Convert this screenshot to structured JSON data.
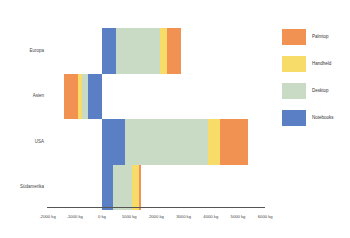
{
  "chart_data": {
    "type": "bar",
    "orientation": "horizontal",
    "stacked": true,
    "title": "",
    "xlabel": "",
    "ylabel": "",
    "categories": [
      "Europa",
      "Asien",
      "USA",
      "Südamerika"
    ],
    "x_ticks": [
      "-2000 kg",
      "-1000 kg",
      "0 kg",
      "1000 kg",
      "2000 kg",
      "3000 kg",
      "4000 kg",
      "5000 kg",
      "6000 kg"
    ],
    "xlim": [
      -2000,
      6000
    ],
    "grid": false,
    "legend_position": "right",
    "series": [
      {
        "name": "Notebooks",
        "color": "#5B7FC4",
        "values": [
          500,
          -500,
          850,
          400
        ]
      },
      {
        "name": "Desktop",
        "color": "#C9DBC4",
        "values": [
          1650,
          -250,
          3050,
          700
        ]
      },
      {
        "name": "Handheld",
        "color": "#F8DC6A",
        "values": [
          250,
          -150,
          450,
          250
        ]
      },
      {
        "name": "Palmtop",
        "color": "#F19253",
        "values": [
          500,
          -500,
          1000,
          100
        ]
      }
    ]
  },
  "legend": [
    {
      "label": "Palmtop",
      "color": "#F19253"
    },
    {
      "label": "Handheld",
      "color": "#F8DC6A"
    },
    {
      "label": "Desktop",
      "color": "#C9DBC4"
    },
    {
      "label": "Notebooks",
      "color": "#5B7FC4"
    }
  ]
}
